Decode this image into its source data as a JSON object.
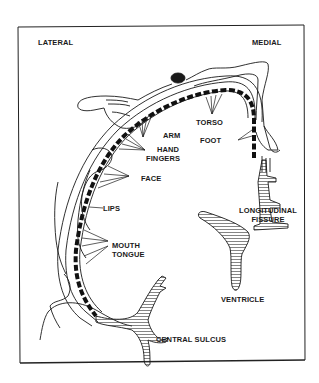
{
  "diagram": {
    "orientation": {
      "left": "LATERAL",
      "right": "MEDIAL"
    },
    "body_regions": [
      {
        "id": "arm",
        "label": "ARM"
      },
      {
        "id": "torso",
        "label": "TORSO"
      },
      {
        "id": "hand",
        "label": "HAND"
      },
      {
        "id": "fingers",
        "label": "FINGERS"
      },
      {
        "id": "foot",
        "label": "FOOT"
      },
      {
        "id": "face",
        "label": "FACE"
      },
      {
        "id": "lips",
        "label": "LIPS"
      },
      {
        "id": "mouth",
        "label": "MOUTH"
      },
      {
        "id": "tongue",
        "label": "TONGUE"
      }
    ],
    "anatomy": {
      "longitudinal": "LONGITUDINAL",
      "fissure": "FISSURE",
      "ventricle": "VENTRICLE",
      "central_sulcus": "CENTRAL SULCUS"
    },
    "colors": {
      "ink": "#1a1a1a",
      "background": "#ffffff"
    }
  }
}
